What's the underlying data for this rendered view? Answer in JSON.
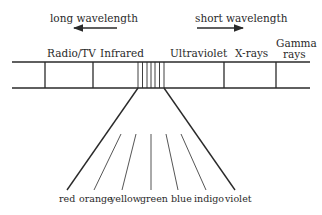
{
  "diagram": {
    "arrows": {
      "long": {
        "label": "long wavelength",
        "direction": "left"
      },
      "short": {
        "label": "short wavelength",
        "direction": "right"
      }
    },
    "bands": [
      {
        "name": "Radio/TV"
      },
      {
        "name": "Infrared"
      },
      {
        "name": "Visible"
      },
      {
        "name": "Ultraviolet"
      },
      {
        "name": "X-rays"
      },
      {
        "name": "Gamma rays",
        "line1": "Gamma",
        "line2": "rays"
      }
    ],
    "visible_colors": [
      "red",
      "orange",
      "yellow",
      "green",
      "blue",
      "indigo",
      "violet"
    ],
    "colors": {
      "stroke": "#2a2a2a",
      "text": "#2a2a2a",
      "background": "#ffffff"
    }
  }
}
